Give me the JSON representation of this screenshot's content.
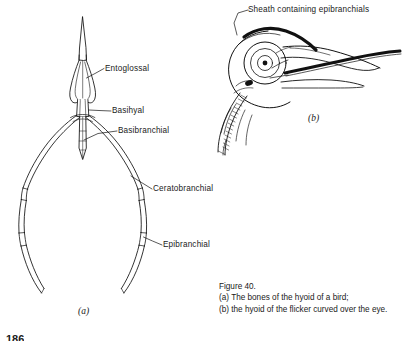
{
  "figure": {
    "background_color": "#ffffff",
    "ink_color": "#111111",
    "caption": {
      "title": "Figure 40.",
      "line_a": "(a) The bones of the hyoid of a bird;",
      "line_b": "(b) the hyoid of the flicker curved over the eye."
    },
    "page_number": "186"
  },
  "panel_a": {
    "letter": "(a)",
    "labels": [
      {
        "id": "entoglossal",
        "text": "Entoglossal"
      },
      {
        "id": "basihyal",
        "text": "Basihyal"
      },
      {
        "id": "basibranchial",
        "text": "Basibranchial"
      },
      {
        "id": "ceratobranchial",
        "text": "Ceratobranchial"
      },
      {
        "id": "epibranchial",
        "text": "Epibranchial"
      }
    ]
  },
  "panel_b": {
    "letter": "(b)",
    "labels": [
      {
        "id": "sheath",
        "text": "Sheath containing epibranchials"
      }
    ]
  }
}
